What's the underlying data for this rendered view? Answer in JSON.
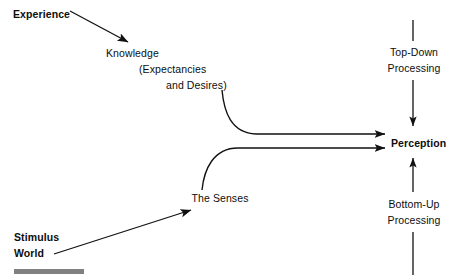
{
  "diagram": {
    "background_color": "#ffffff",
    "stroke_color": "#111111",
    "accent_bar_color": "#808080",
    "nodes": {
      "experience": "Experience",
      "knowledge": "Knowledge",
      "expectancies": "(Expectancies",
      "desires": "and Desires)",
      "senses": "The Senses",
      "stimulus": "Stimulus",
      "world": "World",
      "perception": "Perception",
      "top_down_line1": "Top-Down",
      "top_down_line2": "Processing",
      "bottom_up_line1": "Bottom-Up",
      "bottom_up_line2": "Processing"
    },
    "edges": [
      {
        "name": "experience-to-knowledge",
        "from": "Experience",
        "to": "Knowledge",
        "style": "straight-arrow"
      },
      {
        "name": "knowledge-to-perception",
        "from": "Knowledge (Expectancies and Desires)",
        "to": "Perception",
        "style": "curved-arrow"
      },
      {
        "name": "senses-to-perception",
        "from": "The Senses",
        "to": "Perception",
        "style": "curved-arrow"
      },
      {
        "name": "stimulus-world-to-senses",
        "from": "Stimulus World",
        "to": "The Senses",
        "style": "straight-arrow"
      },
      {
        "name": "top-down-arrow",
        "from": "Top-Down Processing",
        "to": "Perception",
        "style": "vertical-arrow-down"
      },
      {
        "name": "bottom-up-arrow",
        "from": "Bottom-Up Processing",
        "to": "Perception",
        "style": "vertical-arrow-up"
      }
    ]
  }
}
